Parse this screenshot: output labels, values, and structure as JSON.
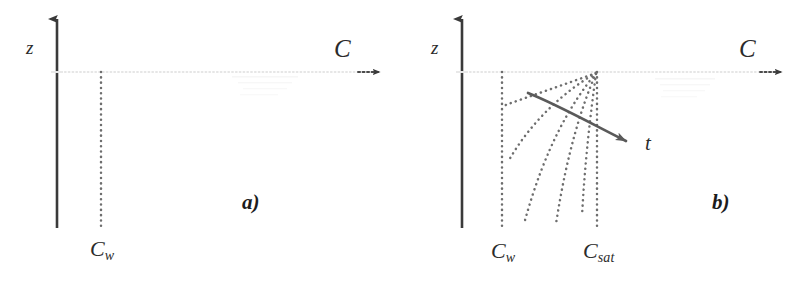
{
  "figure": {
    "width": 797,
    "height": 281,
    "background_color": "#ffffff",
    "axis_color": "#3a3a3a",
    "faint_axis_color": "#dcdcdc",
    "dotted_curve_color": "#6e6e6e",
    "time_arrow_color": "#5a5a5a"
  },
  "panels": [
    {
      "id": "a",
      "tag": "a)",
      "vertical_axis": {
        "label": "z",
        "name": "depth-axis",
        "x": 57,
        "y_top": 14,
        "y_bottom": 228,
        "arrow_direction": "up"
      },
      "horizontal_axis": {
        "label": "C",
        "name": "concentration-axis",
        "y": 72,
        "x_start": 57,
        "x_end": 380,
        "arrow_direction": "right",
        "style": "dotted-faint"
      },
      "profiles": [
        {
          "name": "initial-uniform-profile",
          "label": "Cw",
          "label_base": "C",
          "label_sub": "w",
          "x": 101,
          "y_top": 72,
          "y_bottom": 228,
          "style": "dotted-vertical"
        }
      ]
    },
    {
      "id": "b",
      "tag": "b)",
      "vertical_axis": {
        "label": "z",
        "name": "depth-axis",
        "x": 462,
        "y_top": 14,
        "y_bottom": 228,
        "arrow_direction": "up"
      },
      "horizontal_axis": {
        "label": "C",
        "name": "concentration-axis",
        "y": 72,
        "x_start": 462,
        "x_end": 782,
        "arrow_direction": "right",
        "style": "dotted-faint"
      },
      "profiles": [
        {
          "name": "initial-concentration-line",
          "label": "Cw",
          "label_base": "C",
          "label_sub": "w",
          "x": 502,
          "y_top": 72,
          "y_bottom": 230,
          "style": "dotted-vertical"
        },
        {
          "name": "saturation-concentration-line",
          "label": "Csat",
          "label_base": "C",
          "label_sub": "sat",
          "x": 597,
          "y_top": 72,
          "y_bottom": 230,
          "style": "dotted-vertical"
        }
      ],
      "evolving_profiles": {
        "name": "time-evolving-concentration-fan",
        "count": 5,
        "converge_point": [
          597,
          73
        ],
        "style": "dotted-curve",
        "description": "Fan of concentration profiles evolving with time from the saturated surface toward the bulk value"
      },
      "time_arrow": {
        "name": "time-direction-arrow",
        "label": "t",
        "start": [
          528,
          93
        ],
        "end": [
          633,
          143
        ],
        "style": "solid-curved-arrow"
      }
    }
  ]
}
